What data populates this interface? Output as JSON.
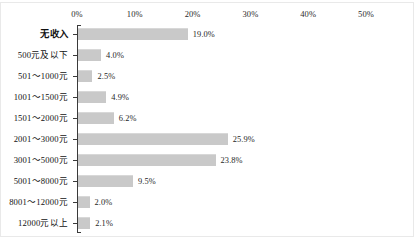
{
  "chart_data": {
    "type": "bar",
    "orientation": "horizontal",
    "title": "",
    "subtitle": "",
    "xlabel": "",
    "ylabel": "",
    "xlim": [
      0,
      50
    ],
    "xtick_labels": [
      "0%",
      "10%",
      "20%",
      "30%",
      "40%",
      "50%"
    ],
    "xticks": [
      0,
      10,
      20,
      30,
      40,
      50
    ],
    "grid": false,
    "legend": false,
    "legend_position": "none",
    "value_suffix": "%",
    "bar_color": "#c9c9c9",
    "axis_color": "#3a3a3a",
    "frame_color": "#e9e9e9",
    "categories": [
      "无收入",
      "500元及以下",
      "501～1000元",
      "1001～1500元",
      "1501～2000元",
      "2001～3000元",
      "3001～5000元",
      "5001～8000元",
      "8001～12000元",
      "12000元以上"
    ],
    "values": [
      19.0,
      4.0,
      2.5,
      4.9,
      6.2,
      25.9,
      23.8,
      9.5,
      2.0,
      2.1
    ],
    "value_labels": [
      "19.0%",
      "4.0%",
      "2.5%",
      "4.9%",
      "6.2%",
      "25.9%",
      "23.8%",
      "9.5%",
      "2.0%",
      "2.1%"
    ],
    "emphasized_categories": [
      "无收入"
    ]
  }
}
